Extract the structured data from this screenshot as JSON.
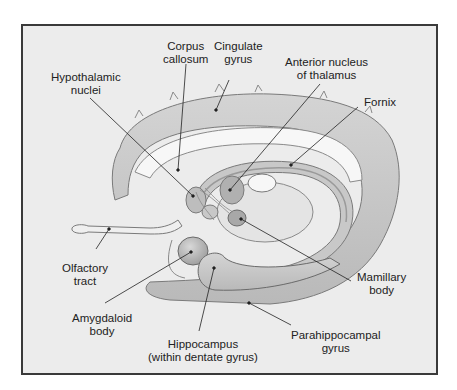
{
  "figure": {
    "background_color": "#ececec",
    "border_color": "#3a3a3a",
    "labels": [
      {
        "id": "corpus-callosum",
        "line1": "Corpus",
        "line2": "callosum"
      },
      {
        "id": "cingulate-gyrus",
        "line1": "Cingulate",
        "line2": "gyrus"
      },
      {
        "id": "hypothalamic-nuclei",
        "line1": "Hypothalamic",
        "line2": "nuclei"
      },
      {
        "id": "anterior-nucleus-thalamus",
        "line1": "Anterior nucleus",
        "line2": "of thalamus"
      },
      {
        "id": "fornix",
        "line1": "Fornix",
        "line2": ""
      },
      {
        "id": "olfactory-tract",
        "line1": "Olfactory",
        "line2": "tract"
      },
      {
        "id": "mamillary-body",
        "line1": "Mamillary",
        "line2": "body"
      },
      {
        "id": "amygdaloid-body",
        "line1": "Amygdaloid",
        "line2": "body"
      },
      {
        "id": "hippocampus",
        "line1": "Hippocampus",
        "line2": "(within dentate gyrus)"
      },
      {
        "id": "parahippocampal-gyrus",
        "line1": "Parahippocampal",
        "line2": "gyrus"
      }
    ]
  }
}
